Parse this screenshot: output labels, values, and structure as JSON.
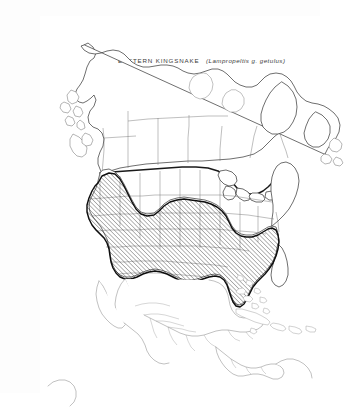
{
  "figure": {
    "kind": "species-range-map",
    "region": "North America",
    "title_common": "EASTERN KINGSNAKE",
    "title_scientific": "(Lampropeltis g. getulus)",
    "title_full": "EASTERN KINGSNAKE (Lampropeltis g. getulus)",
    "background_color": "#ffffff",
    "ink_color": "#1a1a1a",
    "range_pattern": "diagonal-hatch",
    "range_hatch_angle_deg": 45,
    "range_hatch_spacing_px": 3,
    "border_emphasis": "thick-line-us-canada-border"
  },
  "legend": {
    "hatched_meaning": "shaded area = species range",
    "unhatched_meaning": "white area = outside range"
  },
  "range_coverage": {
    "included": [
      "Southeastern United States",
      "Gulf Coast states",
      "Florida peninsula",
      "Mid-Atlantic states",
      "Lower Midwest",
      "Southern Great Plains",
      "Desert Southwest",
      "California",
      "Northern Mexico",
      "Baja California"
    ],
    "excluded": [
      "Canada",
      "Alaska",
      "Northern Great Plains",
      "Pacific Northwest",
      "Northern New England",
      "Southern Mexico",
      "Central America",
      "Caribbean islands"
    ]
  },
  "map_features": {
    "water_bodies": [
      "Great Lakes",
      "Hudson Bay",
      "Gulf of Mexico",
      "Gulf of California"
    ],
    "landmasses": [
      "North America",
      "Greenland edge",
      "Cuba",
      "Hispaniola",
      "Jamaica",
      "Puerto Rico",
      "Bahamas",
      "Newfoundland",
      "Vancouver Island",
      "Baja California"
    ],
    "boundary_types": [
      "national border",
      "state/province boundary",
      "coastline",
      "range boundary"
    ]
  }
}
